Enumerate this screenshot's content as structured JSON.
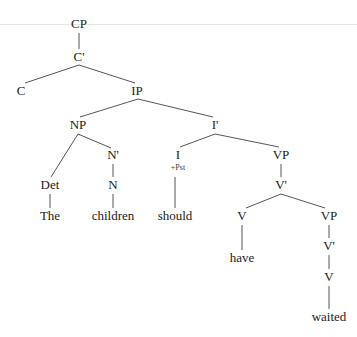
{
  "diagram": {
    "type": "syntax-tree",
    "colors": {
      "edge": "#555555",
      "text": "#222222",
      "rule": "#e6e6e6"
    },
    "nodes": [
      {
        "id": "cp",
        "label": "CP",
        "x": 79,
        "y": 30
      },
      {
        "id": "cbar",
        "label": "C'",
        "x": 79,
        "y": 63
      },
      {
        "id": "c",
        "label": "C",
        "x": 21,
        "y": 97
      },
      {
        "id": "ip",
        "label": "IP",
        "x": 137,
        "y": 97
      },
      {
        "id": "np",
        "label": "NP",
        "x": 78,
        "y": 131
      },
      {
        "id": "ibar",
        "label": "I'",
        "x": 215,
        "y": 131
      },
      {
        "id": "nbar",
        "label": "N'",
        "x": 113,
        "y": 161
      },
      {
        "id": "i",
        "label": "I",
        "x": 178,
        "y": 161
      },
      {
        "id": "vp1",
        "label": "VP",
        "x": 281,
        "y": 161
      },
      {
        "id": "det",
        "label": "Det",
        "x": 50,
        "y": 191
      },
      {
        "id": "n",
        "label": "N",
        "x": 113,
        "y": 191
      },
      {
        "id": "vbar1",
        "label": "V'",
        "x": 281,
        "y": 191
      },
      {
        "id": "the",
        "label": "The",
        "x": 50,
        "y": 222
      },
      {
        "id": "children",
        "label": "children",
        "x": 113,
        "y": 222
      },
      {
        "id": "should",
        "label": "should",
        "x": 175,
        "y": 222
      },
      {
        "id": "v1",
        "label": "V",
        "x": 242,
        "y": 222
      },
      {
        "id": "vp2",
        "label": "VP",
        "x": 329,
        "y": 222
      },
      {
        "id": "vbar2",
        "label": "V'",
        "x": 329,
        "y": 252
      },
      {
        "id": "have",
        "label": "have",
        "x": 242,
        "y": 264
      },
      {
        "id": "v2",
        "label": "V",
        "x": 329,
        "y": 283
      },
      {
        "id": "waited",
        "label": "waited",
        "x": 329,
        "y": 323
      }
    ],
    "features": [
      {
        "id": "pst",
        "label": "+Pst",
        "x": 178,
        "y": 172
      }
    ],
    "edges": [
      {
        "from": "cp",
        "to": "cbar",
        "x1": 79,
        "y1": 33,
        "x2": 79,
        "y2": 49
      },
      {
        "from": "cbar",
        "to": "c",
        "x1": 79,
        "y1": 65,
        "x2": 25,
        "y2": 83
      },
      {
        "from": "cbar",
        "to": "ip",
        "x1": 79,
        "y1": 65,
        "x2": 135,
        "y2": 83
      },
      {
        "from": "ip",
        "to": "np",
        "x1": 138,
        "y1": 99,
        "x2": 80,
        "y2": 117
      },
      {
        "from": "ip",
        "to": "ibar",
        "x1": 138,
        "y1": 99,
        "x2": 213,
        "y2": 117
      },
      {
        "from": "np",
        "to": "det",
        "x1": 78,
        "y1": 134,
        "x2": 51,
        "y2": 177
      },
      {
        "from": "np",
        "to": "nbar",
        "x1": 78,
        "y1": 134,
        "x2": 111,
        "y2": 148
      },
      {
        "from": "nbar",
        "to": "n",
        "x1": 113,
        "y1": 164,
        "x2": 113,
        "y2": 177
      },
      {
        "from": "det",
        "to": "the",
        "x1": 50,
        "y1": 194,
        "x2": 50,
        "y2": 208
      },
      {
        "from": "n",
        "to": "children",
        "x1": 113,
        "y1": 194,
        "x2": 113,
        "y2": 208
      },
      {
        "from": "ibar",
        "to": "i",
        "x1": 215,
        "y1": 134,
        "x2": 180,
        "y2": 147
      },
      {
        "from": "ibar",
        "to": "vp1",
        "x1": 215,
        "y1": 134,
        "x2": 279,
        "y2": 147
      },
      {
        "from": "i",
        "to": "should",
        "x1": 175,
        "y1": 177,
        "x2": 175,
        "y2": 208
      },
      {
        "from": "vp1",
        "to": "vbar1",
        "x1": 281,
        "y1": 164,
        "x2": 281,
        "y2": 177
      },
      {
        "from": "vbar1",
        "to": "v1",
        "x1": 281,
        "y1": 194,
        "x2": 246,
        "y2": 208
      },
      {
        "from": "vbar1",
        "to": "vp2",
        "x1": 281,
        "y1": 194,
        "x2": 325,
        "y2": 208
      },
      {
        "from": "v1",
        "to": "have",
        "x1": 242,
        "y1": 225,
        "x2": 242,
        "y2": 250
      },
      {
        "from": "vp2",
        "to": "vbar2",
        "x1": 329,
        "y1": 225,
        "x2": 329,
        "y2": 238
      },
      {
        "from": "vbar2",
        "to": "v2",
        "x1": 329,
        "y1": 255,
        "x2": 329,
        "y2": 269
      },
      {
        "from": "v2",
        "to": "waited",
        "x1": 329,
        "y1": 286,
        "x2": 329,
        "y2": 309
      }
    ]
  }
}
